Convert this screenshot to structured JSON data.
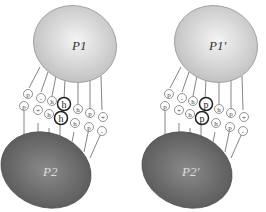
{
  "colors": {
    "top_protein": "#d4d4d4",
    "bottom_protein": "#6a6a6a",
    "line": "#555555",
    "bold_ring": "#222222"
  },
  "panels": [
    {
      "top_label": "P1",
      "bottom_label": "P2",
      "row1": [
        "p",
        "-",
        "h",
        "h",
        "h",
        "p",
        "+"
      ],
      "row2": [
        "p",
        "+",
        "h",
        "h",
        "h",
        "p",
        "-"
      ],
      "highlight_index": 3
    },
    {
      "top_label": "P1'",
      "bottom_label": "P2'",
      "row1": [
        "p",
        "-",
        "h",
        "p",
        "h",
        "p",
        "+"
      ],
      "row2": [
        "p",
        "+",
        "h",
        "p",
        "h",
        "p",
        "-"
      ],
      "highlight_index": 3
    }
  ]
}
